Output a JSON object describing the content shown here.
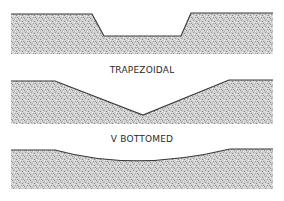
{
  "diagram": {
    "type": "channel cross-sections",
    "colors": {
      "background": "#ffffff",
      "fill_base": "#cfcfcf",
      "stipple_dark": "#8a8a8a",
      "stipple_light": "#f2f2f2",
      "outline": "#3a3a3a",
      "label": "#2a2a2a"
    },
    "sections": [
      {
        "id": "trapezoidal",
        "label": "TRAPEZOIDAL"
      },
      {
        "id": "v-bottomed",
        "label": "V BOTTOMED"
      },
      {
        "id": "curved",
        "label": ""
      }
    ]
  }
}
